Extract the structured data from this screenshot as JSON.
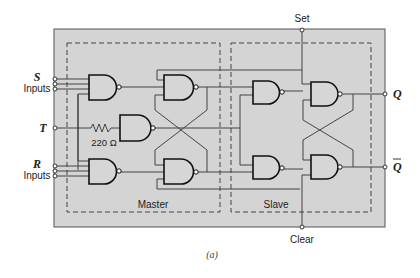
{
  "figure": {
    "caption": "(a)",
    "background_color": "#d4d4d4",
    "line_color": "#333333"
  },
  "labels": {
    "set": "Set",
    "clear": "Clear",
    "s_letter": "S",
    "s_inputs": "Inputs",
    "t_letter": "T",
    "r_letter": "R",
    "r_inputs": "Inputs",
    "resistor": "220 Ω",
    "q": "Q",
    "q_bar": "Q",
    "master": "Master",
    "slave": "Slave"
  },
  "sections": [
    {
      "name": "Master",
      "gates": [
        "S input NAND (3-input)",
        "T NAND",
        "R input NAND (3-input)",
        "Master upper NAND",
        "Master lower NAND"
      ]
    },
    {
      "name": "Slave",
      "gates": [
        "Slave input NAND upper",
        "Slave input NAND lower",
        "Slave output NAND Q",
        "Slave output NAND Q-bar"
      ]
    }
  ],
  "terminals": [
    "S inputs (3)",
    "T",
    "R inputs (3)",
    "Set",
    "Clear",
    "Q",
    "Q-bar"
  ]
}
